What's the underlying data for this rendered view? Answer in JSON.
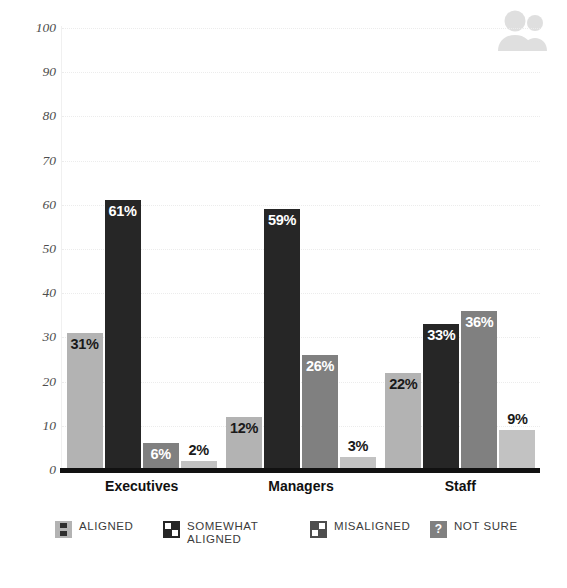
{
  "decor": {
    "people_icon": "people-icon",
    "people_icon_color": "#d9d9d9"
  },
  "legend": {
    "position": "bottom",
    "items": [
      {
        "label": "ALIGNED",
        "color": "#b3b3b3",
        "marker": "aligned-swatch-icon"
      },
      {
        "label": "SOMEWHAT\nALIGNED",
        "color": "#262626",
        "marker": "somewhat-aligned-swatch-icon"
      },
      {
        "label": "MISALIGNED",
        "color": "#4d4d4d",
        "marker": "misaligned-swatch-icon"
      },
      {
        "label": "NOT SURE",
        "color": "#808080",
        "marker": "not-sure-question-icon"
      }
    ]
  },
  "chart_data": {
    "type": "bar",
    "title": "",
    "xlabel": "",
    "ylabel": "",
    "ylim": [
      0,
      100
    ],
    "ytick_step": 10,
    "yticks": [
      "0",
      "10",
      "20",
      "30",
      "40",
      "50",
      "60",
      "70",
      "80",
      "90",
      "100"
    ],
    "grid": true,
    "categories": [
      "Executives",
      "Managers",
      "Staff"
    ],
    "series": [
      {
        "name": "ALIGNED",
        "color": "#b3b3b3",
        "label_color": "#1a1a1a",
        "values": [
          31,
          12,
          22
        ],
        "value_labels": [
          "31%",
          "12%",
          "22%"
        ]
      },
      {
        "name": "SOMEWHAT ALIGNED",
        "color": "#262626",
        "label_color": "#ffffff",
        "values": [
          61,
          59,
          33
        ],
        "value_labels": [
          "61%",
          "59%",
          "33%"
        ]
      },
      {
        "name": "MISALIGNED",
        "color": "#808080",
        "label_color": "#ffffff",
        "values": [
          6,
          26,
          36
        ],
        "value_labels": [
          "6%",
          "26%",
          "36%"
        ]
      },
      {
        "name": "NOT SURE",
        "color": "#c2c2c2",
        "label_color": "#1a1a1a",
        "values": [
          2,
          3,
          9
        ],
        "value_labels": [
          "2%",
          "3%",
          "9%"
        ]
      }
    ]
  }
}
